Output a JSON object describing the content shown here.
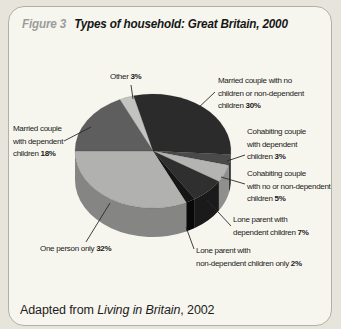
{
  "window": {
    "width": 341,
    "height": 329
  },
  "panel": {
    "figure_label": "Figure 3",
    "title": "Types of household: Great Britain, 2000",
    "footer_prefix": "Adapted from ",
    "footer_source": "Living in Britain",
    "footer_suffix": ", 2002"
  },
  "colors": {
    "page_bg": "#e7e5db",
    "panel_bg": "#f7f6ee",
    "panel_border": "#b1b0a8",
    "figure_label_gray": "#9c9c9c",
    "title_black": "#161616",
    "label_text": "#1a1a1a",
    "leader_line": "#2a2a2a"
  },
  "chart_data": {
    "type": "pie",
    "style": "3d",
    "title": "Types of household: Great Britain, 2000",
    "unit": "percent",
    "direction": "clockwise",
    "start_angle_deg": 334.8,
    "legend_position": "none",
    "categories": [
      "Other",
      "Married couple with no children or non-dependent children",
      "Cohabiting couple with dependent children",
      "Cohabiting couple with no or non-dependent children",
      "Lone parent with dependent children",
      "Lone parent with non-dependent children only",
      "One person only",
      "Married couple with dependent children"
    ],
    "values": [
      3,
      30,
      3,
      5,
      7,
      2,
      32,
      18
    ],
    "geometry": {
      "cx": 153,
      "cy": 151,
      "rx": 78,
      "ry": 57,
      "depth": 29
    },
    "slices": [
      {
        "key": "other",
        "value": 3,
        "color": "#c3c3c1",
        "side_color": "#9a9a98",
        "label": {
          "x": 110,
          "y": 71,
          "lines": [
            "Other"
          ],
          "pct": "3%"
        },
        "leader": {
          "x1": 131,
          "y1": 85,
          "x2": 133,
          "y2": 99
        }
      },
      {
        "key": "married-no-children",
        "value": 30,
        "color": "#2b2b2b",
        "side_color": "#1f1f1f",
        "label": {
          "x": 218,
          "y": 75,
          "lines": [
            "Married couple with no",
            "children or non-dependent",
            "children"
          ],
          "pct": "30%"
        },
        "leader": {
          "x1": 215,
          "y1": 92,
          "x2": 196,
          "y2": 110
        }
      },
      {
        "key": "cohabiting-dependent",
        "value": 3,
        "color": "#4a4a4a",
        "side_color": "#343434",
        "label": {
          "x": 247,
          "y": 126,
          "lines": [
            "Cohabiting couple",
            "with dependent",
            "children"
          ],
          "pct": "3%"
        },
        "leader": {
          "x1": 245,
          "y1": 155,
          "x2": 227,
          "y2": 161
        }
      },
      {
        "key": "cohabiting-non-dependent",
        "value": 5,
        "color": "#b4b4b2",
        "side_color": "#8f8f8d",
        "label": {
          "x": 247,
          "y": 168,
          "lines": [
            "Cohabiting couple",
            "with no or non-dependent",
            "children"
          ],
          "pct": "5%"
        },
        "leader": {
          "x1": 245,
          "y1": 184,
          "x2": 221,
          "y2": 177
        }
      },
      {
        "key": "lone-parent-dependent",
        "value": 7,
        "color": "#2f2f2f",
        "side_color": "#1a1a1a",
        "label": {
          "x": 233,
          "y": 214,
          "lines": [
            "Lone parent with",
            "dependent children"
          ],
          "pct": "7%"
        },
        "leader": {
          "x1": 231,
          "y1": 226,
          "x2": 207,
          "y2": 200
        }
      },
      {
        "key": "lone-parent-non-dependent",
        "value": 2,
        "color": "#151515",
        "side_color": "#090909",
        "label": {
          "x": 196,
          "y": 245,
          "lines": [
            "Lone parent with",
            "non-dependent children only"
          ],
          "pct": "2%"
        },
        "leader": {
          "x1": 194,
          "y1": 249,
          "x2": 186,
          "y2": 227
        }
      },
      {
        "key": "one-person",
        "value": 32,
        "color": "#b1b1af",
        "side_color": "#858583",
        "label": {
          "x": 40,
          "y": 243,
          "lines": [
            "One person only"
          ],
          "pct": "32%"
        },
        "leader": {
          "x1": 86,
          "y1": 242,
          "x2": 110,
          "y2": 203
        }
      },
      {
        "key": "married-dependent",
        "value": 18,
        "color": "#5e5e5e",
        "side_color": "#474747",
        "label": {
          "x": 13,
          "y": 123,
          "lines": [
            "Married couple",
            "with dependent",
            "children"
          ],
          "pct": "18%"
        },
        "leader": {
          "x1": 64,
          "y1": 141,
          "x2": 91,
          "y2": 127
        }
      }
    ]
  }
}
